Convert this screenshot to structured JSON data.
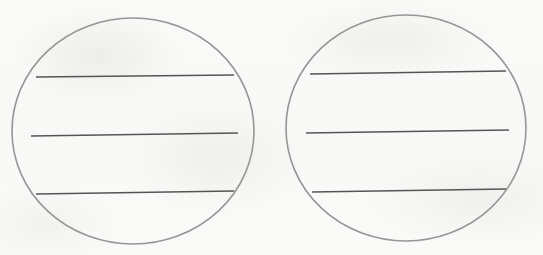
{
  "canvas": {
    "width": 543,
    "height": 255,
    "background_color": "#fcfcfb",
    "description": "Hand-drawn sketch: two large circles side by side, each crossed by three horizontal lines"
  },
  "style": {
    "circle_stroke_color": "#969696",
    "circle_stroke_width": 1.6,
    "line_stroke_color": "#555555",
    "line_stroke_width": 1.5,
    "fill": "none"
  },
  "shapes": {
    "circles": [
      {
        "name": "left-circle",
        "cx": 133,
        "cy": 131,
        "rx": 121,
        "ry": 113
      },
      {
        "name": "right-circle",
        "cx": 406,
        "cy": 128,
        "rx": 120,
        "ry": 113
      }
    ],
    "lines": [
      {
        "name": "left-circle-line-1",
        "group": "left-circle",
        "index": 1,
        "x1": 36,
        "y1": 77,
        "x2": 234,
        "y2": 75
      },
      {
        "name": "left-circle-line-2",
        "group": "left-circle",
        "index": 2,
        "x1": 31,
        "y1": 136,
        "x2": 238,
        "y2": 133
      },
      {
        "name": "left-circle-line-3",
        "group": "left-circle",
        "index": 3,
        "x1": 36,
        "y1": 194,
        "x2": 234,
        "y2": 191
      },
      {
        "name": "right-circle-line-1",
        "group": "right-circle",
        "index": 1,
        "x1": 310,
        "y1": 74,
        "x2": 506,
        "y2": 71
      },
      {
        "name": "right-circle-line-2",
        "group": "right-circle",
        "index": 2,
        "x1": 306,
        "y1": 133,
        "x2": 509,
        "y2": 130
      },
      {
        "name": "right-circle-line-3",
        "group": "right-circle",
        "index": 3,
        "x1": 312,
        "y1": 192,
        "x2": 506,
        "y2": 189
      }
    ]
  }
}
